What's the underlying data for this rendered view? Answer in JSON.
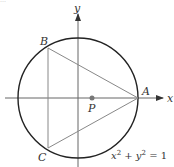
{
  "diagram": {
    "title_fragment": "…",
    "axes": {
      "x_label": "x",
      "y_label": "y"
    },
    "circle": {
      "equation_parts": {
        "x": "x",
        "plus": " + ",
        "y": "y",
        "exp": "2",
        "equals": " = 1"
      },
      "equation": "x² + y² = 1"
    },
    "points": {
      "A": "A",
      "B": "B",
      "C": "C",
      "P": "P"
    },
    "colors": {
      "circle": "#222222",
      "triangle": "#888888",
      "axes": "#666666",
      "point_p": "#777777"
    }
  }
}
